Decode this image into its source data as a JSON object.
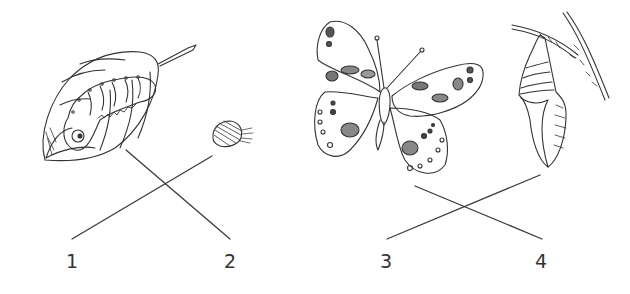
{
  "diagram": {
    "type": "matching-exercise",
    "stroke_color": "#333333",
    "background": "#ffffff",
    "illustrations": [
      {
        "id": "caterpillar-on-leaf",
        "description": "caterpillar on a leaf"
      },
      {
        "id": "egg",
        "description": "egg"
      },
      {
        "id": "butterfly",
        "description": "adult butterfly"
      },
      {
        "id": "chrysalis",
        "description": "chrysalis hanging from a branch"
      }
    ],
    "labels": [
      "1",
      "2",
      "3",
      "4"
    ],
    "connectors": [
      {
        "from": "caterpillar-on-leaf",
        "to_label": "2"
      },
      {
        "from": "egg",
        "to_label": "1"
      },
      {
        "from": "butterfly",
        "to_label": "4"
      },
      {
        "from": "chrysalis",
        "to_label": "3"
      }
    ]
  }
}
